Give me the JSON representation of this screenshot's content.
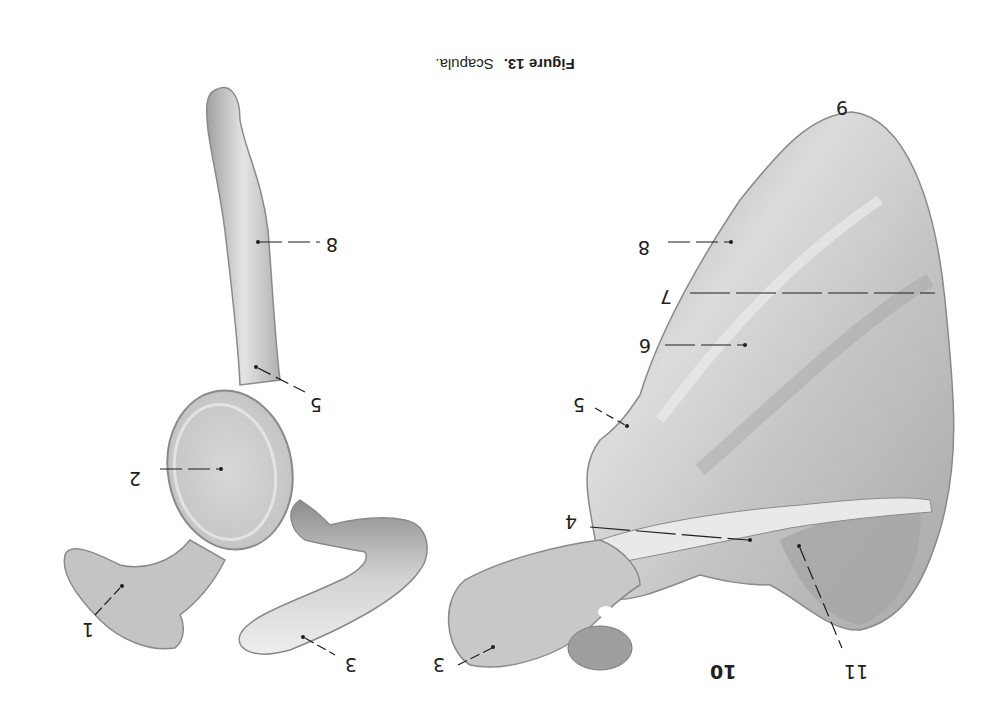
{
  "figure": {
    "caption_label": "Figure 13.",
    "caption_title": "Scapula.",
    "orientation": "rotated 180 degrees"
  },
  "right_view": {
    "labels": [
      {
        "text": "9",
        "x": 836,
        "y": 98
      },
      {
        "text": "8",
        "x": 638,
        "y": 238
      },
      {
        "text": "7",
        "x": 660,
        "y": 287
      },
      {
        "text": "6",
        "x": 639,
        "y": 336
      },
      {
        "text": "5",
        "x": 573,
        "y": 395
      },
      {
        "text": "4",
        "x": 565,
        "y": 512
      },
      {
        "text": "3",
        "x": 433,
        "y": 655
      },
      {
        "text": "10",
        "x": 710,
        "y": 662,
        "bold": true
      },
      {
        "text": "11",
        "x": 844,
        "y": 662
      }
    ]
  },
  "left_view": {
    "labels": [
      {
        "text": "8",
        "x": 326,
        "y": 235
      },
      {
        "text": "5",
        "x": 310,
        "y": 395
      },
      {
        "text": "2",
        "x": 129,
        "y": 469
      },
      {
        "text": "1",
        "x": 82,
        "y": 620
      },
      {
        "text": "3",
        "x": 345,
        "y": 655
      }
    ]
  },
  "colors": {
    "background": "#ffffff",
    "bone_light": "#e6e6e6",
    "bone_mid": "#bdbdbd",
    "bone_dark": "#8a8a8a",
    "ink": "#1e1e1e"
  }
}
